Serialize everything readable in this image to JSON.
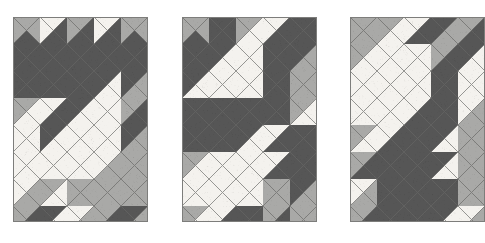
{
  "figure": {
    "background_color": "#ffffff",
    "width": 485,
    "height": 243
  },
  "palette": {
    "white": "#f4f2ee",
    "light": "#a9a9a7",
    "dark": "#565656",
    "mid": "#8a8a88",
    "grid_line": "#6e6e6c",
    "panel_border": "#7d7d7b"
  },
  "geometry": {
    "cell_size": 27,
    "columns": 5,
    "rows": 8,
    "note": "Each cell holds 4 triangles in order north, east, south, west."
  },
  "chart_data": {
    "type": "heatmap",
    "xlabel": "",
    "ylabel": "",
    "legend": [
      "white",
      "light",
      "dark"
    ],
    "panels": [
      {
        "name": "panel-1",
        "x": 13,
        "y": 17,
        "width": 135,
        "height": 205,
        "cols": 5,
        "rows": 8,
        "cells": [
          [
            [
              "light",
              "light",
              "dark",
              "light"
            ],
            [
              "white",
              "dark",
              "dark",
              "white"
            ],
            [
              "light",
              "dark",
              "dark",
              "light"
            ],
            [
              "white",
              "dark",
              "dark",
              "white"
            ],
            [
              "light",
              "light",
              "dark",
              "light"
            ]
          ],
          [
            [
              "dark",
              "dark",
              "dark",
              "dark"
            ],
            [
              "dark",
              "dark",
              "dark",
              "dark"
            ],
            [
              "dark",
              "dark",
              "dark",
              "dark"
            ],
            [
              "dark",
              "dark",
              "dark",
              "dark"
            ],
            [
              "dark",
              "dark",
              "dark",
              "dark"
            ]
          ],
          [
            [
              "dark",
              "dark",
              "dark",
              "dark"
            ],
            [
              "dark",
              "dark",
              "dark",
              "dark"
            ],
            [
              "dark",
              "dark",
              "dark",
              "dark"
            ],
            [
              "dark",
              "white",
              "white",
              "dark"
            ],
            [
              "dark",
              "light",
              "light",
              "dark"
            ]
          ],
          [
            [
              "light",
              "white",
              "white",
              "light"
            ],
            [
              "white",
              "dark",
              "dark",
              "white"
            ],
            [
              "dark",
              "white",
              "white",
              "dark"
            ],
            [
              "white",
              "white",
              "white",
              "white"
            ],
            [
              "light",
              "dark",
              "dark",
              "light"
            ]
          ],
          [
            [
              "white",
              "white",
              "white",
              "white"
            ],
            [
              "dark",
              "white",
              "white",
              "dark"
            ],
            [
              "white",
              "white",
              "white",
              "white"
            ],
            [
              "white",
              "white",
              "white",
              "white"
            ],
            [
              "dark",
              "light",
              "light",
              "dark"
            ]
          ],
          [
            [
              "white",
              "white",
              "white",
              "white"
            ],
            [
              "white",
              "white",
              "white",
              "white"
            ],
            [
              "white",
              "white",
              "white",
              "white"
            ],
            [
              "white",
              "light",
              "light",
              "white"
            ],
            [
              "light",
              "light",
              "light",
              "light"
            ]
          ],
          [
            [
              "white",
              "light",
              "light",
              "white"
            ],
            [
              "light",
              "white",
              "white",
              "light"
            ],
            [
              "light",
              "light",
              "light",
              "light"
            ],
            [
              "light",
              "light",
              "light",
              "light"
            ],
            [
              "light",
              "light",
              "light",
              "light"
            ]
          ],
          [
            [
              "light",
              "dark",
              "dark",
              "light"
            ],
            [
              "dark",
              "white",
              "white",
              "dark"
            ],
            [
              "white",
              "light",
              "light",
              "white"
            ],
            [
              "light",
              "dark",
              "dark",
              "light"
            ],
            [
              "dark",
              "light",
              "light",
              "dark"
            ]
          ]
        ]
      },
      {
        "name": "panel-2",
        "x": 182,
        "y": 17,
        "width": 135,
        "height": 205,
        "cols": 5,
        "rows": 8,
        "cells": [
          [
            [
              "light",
              "light",
              "dark",
              "light"
            ],
            [
              "dark",
              "dark",
              "dark",
              "dark"
            ],
            [
              "light",
              "white",
              "white",
              "light"
            ],
            [
              "white",
              "dark",
              "dark",
              "white"
            ],
            [
              "dark",
              "dark",
              "dark",
              "dark"
            ]
          ],
          [
            [
              "dark",
              "dark",
              "dark",
              "dark"
            ],
            [
              "dark",
              "white",
              "white",
              "dark"
            ],
            [
              "white",
              "white",
              "white",
              "white"
            ],
            [
              "dark",
              "dark",
              "dark",
              "dark"
            ],
            [
              "dark",
              "light",
              "light",
              "dark"
            ]
          ],
          [
            [
              "dark",
              "white",
              "white",
              "dark"
            ],
            [
              "white",
              "white",
              "white",
              "white"
            ],
            [
              "white",
              "white",
              "white",
              "white"
            ],
            [
              "dark",
              "dark",
              "dark",
              "dark"
            ],
            [
              "light",
              "light",
              "light",
              "light"
            ]
          ],
          [
            [
              "dark",
              "dark",
              "dark",
              "dark"
            ],
            [
              "dark",
              "dark",
              "dark",
              "dark"
            ],
            [
              "dark",
              "dark",
              "dark",
              "dark"
            ],
            [
              "dark",
              "dark",
              "dark",
              "dark"
            ],
            [
              "light",
              "white",
              "white",
              "light"
            ]
          ],
          [
            [
              "dark",
              "dark",
              "dark",
              "dark"
            ],
            [
              "dark",
              "dark",
              "dark",
              "dark"
            ],
            [
              "dark",
              "white",
              "white",
              "dark"
            ],
            [
              "white",
              "dark",
              "dark",
              "white"
            ],
            [
              "dark",
              "dark",
              "dark",
              "dark"
            ]
          ],
          [
            [
              "light",
              "white",
              "white",
              "light"
            ],
            [
              "white",
              "white",
              "white",
              "white"
            ],
            [
              "white",
              "white",
              "white",
              "white"
            ],
            [
              "white",
              "dark",
              "dark",
              "white"
            ],
            [
              "dark",
              "dark",
              "dark",
              "dark"
            ]
          ],
          [
            [
              "white",
              "white",
              "white",
              "white"
            ],
            [
              "white",
              "white",
              "white",
              "white"
            ],
            [
              "white",
              "white",
              "white",
              "white"
            ],
            [
              "light",
              "light",
              "light",
              "light"
            ],
            [
              "dark",
              "light",
              "light",
              "dark"
            ]
          ],
          [
            [
              "light",
              "white",
              "white",
              "light"
            ],
            [
              "white",
              "dark",
              "dark",
              "white"
            ],
            [
              "dark",
              "dark",
              "dark",
              "dark"
            ],
            [
              "light",
              "dark",
              "dark",
              "light"
            ],
            [
              "light",
              "light",
              "light",
              "light"
            ]
          ]
        ]
      },
      {
        "name": "panel-3",
        "x": 350,
        "y": 17,
        "width": 135,
        "height": 205,
        "cols": 5,
        "rows": 8,
        "cells": [
          [
            [
              "light",
              "light",
              "light",
              "light"
            ],
            [
              "light",
              "white",
              "white",
              "light"
            ],
            [
              "white",
              "dark",
              "dark",
              "white"
            ],
            [
              "dark",
              "light",
              "light",
              "dark"
            ],
            [
              "light",
              "dark",
              "dark",
              "light"
            ]
          ],
          [
            [
              "light",
              "white",
              "white",
              "light"
            ],
            [
              "white",
              "white",
              "white",
              "white"
            ],
            [
              "white",
              "white",
              "white",
              "white"
            ],
            [
              "light",
              "dark",
              "dark",
              "light"
            ],
            [
              "dark",
              "white",
              "white",
              "dark"
            ]
          ],
          [
            [
              "white",
              "white",
              "white",
              "white"
            ],
            [
              "white",
              "white",
              "white",
              "white"
            ],
            [
              "white",
              "white",
              "white",
              "white"
            ],
            [
              "dark",
              "dark",
              "dark",
              "dark"
            ],
            [
              "white",
              "white",
              "white",
              "white"
            ]
          ],
          [
            [
              "white",
              "white",
              "white",
              "white"
            ],
            [
              "white",
              "white",
              "white",
              "white"
            ],
            [
              "white",
              "dark",
              "dark",
              "white"
            ],
            [
              "dark",
              "dark",
              "dark",
              "dark"
            ],
            [
              "white",
              "light",
              "light",
              "white"
            ]
          ],
          [
            [
              "light",
              "white",
              "white",
              "light"
            ],
            [
              "white",
              "dark",
              "dark",
              "white"
            ],
            [
              "dark",
              "dark",
              "dark",
              "dark"
            ],
            [
              "dark",
              "white",
              "white",
              "dark"
            ],
            [
              "light",
              "light",
              "light",
              "light"
            ]
          ],
          [
            [
              "light",
              "dark",
              "dark",
              "light"
            ],
            [
              "dark",
              "dark",
              "dark",
              "dark"
            ],
            [
              "dark",
              "dark",
              "dark",
              "dark"
            ],
            [
              "dark",
              "white",
              "white",
              "dark"
            ],
            [
              "light",
              "light",
              "light",
              "light"
            ]
          ],
          [
            [
              "white",
              "light",
              "light",
              "white"
            ],
            [
              "dark",
              "dark",
              "dark",
              "dark"
            ],
            [
              "dark",
              "dark",
              "dark",
              "dark"
            ],
            [
              "dark",
              "dark",
              "dark",
              "dark"
            ],
            [
              "light",
              "light",
              "light",
              "light"
            ]
          ],
          [
            [
              "light",
              "dark",
              "dark",
              "light"
            ],
            [
              "dark",
              "dark",
              "dark",
              "dark"
            ],
            [
              "dark",
              "dark",
              "dark",
              "dark"
            ],
            [
              "dark",
              "white",
              "white",
              "dark"
            ],
            [
              "white",
              "light",
              "light",
              "white"
            ]
          ]
        ]
      }
    ]
  }
}
